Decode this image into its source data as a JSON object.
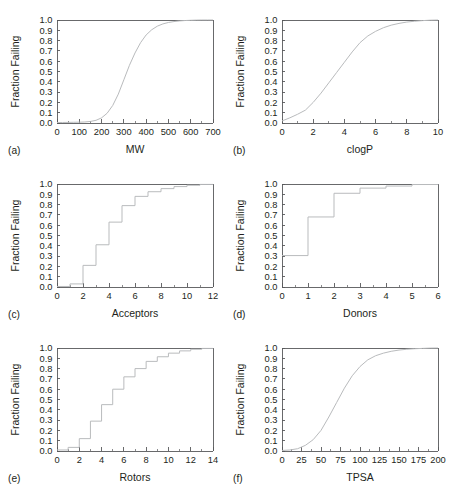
{
  "figure": {
    "ylabel": "Fraction Failing",
    "y_ticks": [
      "0.0",
      "0.1",
      "0.2",
      "0.3",
      "0.4",
      "0.5",
      "0.6",
      "0.7",
      "0.8",
      "0.9",
      "1.0"
    ],
    "curve_color": "#b9bbbd",
    "axis_color": "#58595b",
    "text_color": "#231f20",
    "background": "#ffffff",
    "bottom_caption_fragment": ""
  },
  "panels": [
    {
      "letter": "(a)",
      "xlabel": "MW"
    },
    {
      "letter": "(b)",
      "xlabel": "clogP"
    },
    {
      "letter": "(c)",
      "xlabel": "Acceptors"
    },
    {
      "letter": "(d)",
      "xlabel": "Donors"
    },
    {
      "letter": "(e)",
      "xlabel": "Rotors"
    },
    {
      "letter": "(f)",
      "xlabel": "TPSA"
    }
  ],
  "chart_data": [
    {
      "type": "line",
      "title": "",
      "panel": "(a)",
      "xlabel": "MW",
      "ylabel": "Fraction Failing",
      "xlim": [
        0,
        700
      ],
      "ylim": [
        0,
        1
      ],
      "xticks": [
        0,
        100,
        200,
        300,
        400,
        500,
        600,
        700
      ],
      "xticklabels": [
        "0",
        "100",
        "200",
        "300",
        "400",
        "500",
        "600",
        "700"
      ],
      "xminorticks": [
        50,
        150,
        250,
        350,
        450,
        550,
        650
      ],
      "yticks": [
        0,
        0.1,
        0.2,
        0.3,
        0.4,
        0.5,
        0.6,
        0.7,
        0.8,
        0.9,
        1.0
      ],
      "yticklabels": [
        "0.0",
        "0.1",
        "0.2",
        "0.3",
        "0.4",
        "0.5",
        "0.6",
        "0.7",
        "0.8",
        "0.9",
        "1.0"
      ],
      "grid": false,
      "legend": null,
      "x": [
        0,
        25,
        50,
        75,
        100,
        125,
        150,
        175,
        200,
        225,
        250,
        275,
        300,
        325,
        350,
        375,
        400,
        425,
        450,
        475,
        500,
        525,
        550,
        575,
        600,
        625,
        650,
        675,
        700
      ],
      "y": [
        0.005,
        0.005,
        0.006,
        0.007,
        0.008,
        0.01,
        0.015,
        0.026,
        0.05,
        0.095,
        0.17,
        0.28,
        0.42,
        0.56,
        0.68,
        0.78,
        0.855,
        0.905,
        0.94,
        0.962,
        0.976,
        0.985,
        0.991,
        0.995,
        0.997,
        0.999,
        1.0,
        1.0,
        1.0
      ]
    },
    {
      "type": "line",
      "title": "",
      "panel": "(b)",
      "xlabel": "clogP",
      "ylabel": "Fraction Failing",
      "xlim": [
        0,
        10
      ],
      "ylim": [
        0,
        1
      ],
      "xticks": [
        0,
        2,
        4,
        6,
        8,
        10
      ],
      "xticklabels": [
        "0",
        "2",
        "4",
        "6",
        "8",
        "10"
      ],
      "xminorticks": [
        1,
        3,
        5,
        7,
        9
      ],
      "yticks": [
        0,
        0.1,
        0.2,
        0.3,
        0.4,
        0.5,
        0.6,
        0.7,
        0.8,
        0.9,
        1.0
      ],
      "yticklabels": [
        "0.0",
        "0.1",
        "0.2",
        "0.3",
        "0.4",
        "0.5",
        "0.6",
        "0.7",
        "0.8",
        "0.9",
        "1.0"
      ],
      "grid": false,
      "legend": null,
      "x": [
        0,
        0.5,
        1.0,
        1.5,
        2.0,
        2.5,
        3.0,
        3.5,
        4.0,
        4.5,
        5.0,
        5.5,
        6.0,
        6.5,
        7.0,
        7.5,
        8.0,
        8.5,
        9.0,
        9.5,
        10.0
      ],
      "y": [
        0.02,
        0.05,
        0.085,
        0.125,
        0.2,
        0.29,
        0.39,
        0.49,
        0.59,
        0.69,
        0.78,
        0.845,
        0.89,
        0.925,
        0.95,
        0.967,
        0.98,
        0.988,
        0.994,
        0.998,
        1.0
      ]
    },
    {
      "type": "line",
      "title": "",
      "panel": "(c)",
      "xlabel": "Acceptors",
      "ylabel": "Fraction Failing",
      "xlim": [
        0,
        12
      ],
      "ylim": [
        0,
        1
      ],
      "xticks": [
        0,
        2,
        4,
        6,
        8,
        10,
        12
      ],
      "xticklabels": [
        "0",
        "2",
        "4",
        "6",
        "8",
        "10",
        "12"
      ],
      "xminorticks": [
        1,
        3,
        5,
        7,
        9,
        11
      ],
      "yticks": [
        0,
        0.1,
        0.2,
        0.3,
        0.4,
        0.5,
        0.6,
        0.7,
        0.8,
        0.9,
        1.0
      ],
      "yticklabels": [
        "0.0",
        "0.1",
        "0.2",
        "0.3",
        "0.4",
        "0.5",
        "0.6",
        "0.7",
        "0.8",
        "0.9",
        "1.0"
      ],
      "grid": false,
      "legend": null,
      "step": "post",
      "x": [
        0,
        1,
        2,
        3,
        4,
        5,
        6,
        7,
        8,
        9,
        10,
        11,
        12
      ],
      "y": [
        0.005,
        0.03,
        0.21,
        0.41,
        0.63,
        0.79,
        0.88,
        0.925,
        0.955,
        0.975,
        0.988,
        0.996,
        1.0
      ]
    },
    {
      "type": "line",
      "title": "",
      "panel": "(d)",
      "xlabel": "Donors",
      "ylabel": "Fraction Failing",
      "xlim": [
        0,
        6
      ],
      "ylim": [
        0,
        1
      ],
      "xticks": [
        0,
        1,
        2,
        3,
        4,
        5,
        6
      ],
      "xticklabels": [
        "0",
        "1",
        "2",
        "3",
        "4",
        "5",
        "6"
      ],
      "xminorticks": [
        0.5,
        1.5,
        2.5,
        3.5,
        4.5,
        5.5
      ],
      "yticks": [
        0,
        0.1,
        0.2,
        0.3,
        0.4,
        0.5,
        0.6,
        0.7,
        0.8,
        0.9,
        1.0
      ],
      "yticklabels": [
        "0.0",
        "0.1",
        "0.2",
        "0.3",
        "0.4",
        "0.5",
        "0.6",
        "0.7",
        "0.8",
        "0.9",
        "1.0"
      ],
      "grid": false,
      "legend": null,
      "step": "post",
      "x": [
        0,
        1,
        2,
        3,
        4,
        5,
        6
      ],
      "y": [
        0.305,
        0.68,
        0.91,
        0.96,
        0.98,
        0.995,
        1.0
      ]
    },
    {
      "type": "line",
      "title": "",
      "panel": "(e)",
      "xlabel": "Rotors",
      "ylabel": "Fraction Failing",
      "xlim": [
        0,
        14
      ],
      "ylim": [
        0,
        1
      ],
      "xticks": [
        0,
        2,
        4,
        6,
        8,
        10,
        12,
        14
      ],
      "xticklabels": [
        "0",
        "2",
        "4",
        "6",
        "8",
        "10",
        "12",
        "14"
      ],
      "xminorticks": [
        1,
        3,
        5,
        7,
        9,
        11,
        13
      ],
      "yticks": [
        0,
        0.1,
        0.2,
        0.3,
        0.4,
        0.5,
        0.6,
        0.7,
        0.8,
        0.9,
        1.0
      ],
      "yticklabels": [
        "0.0",
        "0.1",
        "0.2",
        "0.3",
        "0.4",
        "0.5",
        "0.6",
        "0.7",
        "0.8",
        "0.9",
        "1.0"
      ],
      "grid": false,
      "legend": null,
      "step": "post",
      "x": [
        0,
        1,
        2,
        3,
        4,
        5,
        6,
        7,
        8,
        9,
        10,
        11,
        12,
        13,
        14
      ],
      "y": [
        0.01,
        0.035,
        0.12,
        0.29,
        0.45,
        0.6,
        0.72,
        0.8,
        0.87,
        0.915,
        0.95,
        0.972,
        0.988,
        0.996,
        1.0
      ]
    },
    {
      "type": "line",
      "title": "",
      "panel": "(f)",
      "xlabel": "TPSA",
      "ylabel": "Fraction Failing",
      "xlim": [
        0,
        200
      ],
      "ylim": [
        0,
        1
      ],
      "xticks": [
        0,
        25,
        50,
        75,
        100,
        125,
        150,
        175,
        200
      ],
      "xticklabels": [
        "0",
        "25",
        "50",
        "75",
        "100",
        "125",
        "150",
        "175",
        "200"
      ],
      "xminorticks": [
        12.5,
        37.5,
        62.5,
        87.5,
        112.5,
        137.5,
        162.5,
        187.5
      ],
      "yticks": [
        0,
        0.1,
        0.2,
        0.3,
        0.4,
        0.5,
        0.6,
        0.7,
        0.8,
        0.9,
        1.0
      ],
      "yticklabels": [
        "0.0",
        "0.1",
        "0.2",
        "0.3",
        "0.4",
        "0.5",
        "0.6",
        "0.7",
        "0.8",
        "0.9",
        "1.0"
      ],
      "grid": false,
      "legend": null,
      "x": [
        0,
        10,
        20,
        30,
        40,
        50,
        60,
        70,
        80,
        90,
        100,
        110,
        120,
        130,
        140,
        150,
        160,
        170,
        180,
        190,
        200
      ],
      "y": [
        0.005,
        0.01,
        0.022,
        0.055,
        0.11,
        0.2,
        0.33,
        0.47,
        0.61,
        0.73,
        0.82,
        0.885,
        0.925,
        0.95,
        0.968,
        0.98,
        0.988,
        0.993,
        0.996,
        0.999,
        1.0
      ]
    }
  ]
}
